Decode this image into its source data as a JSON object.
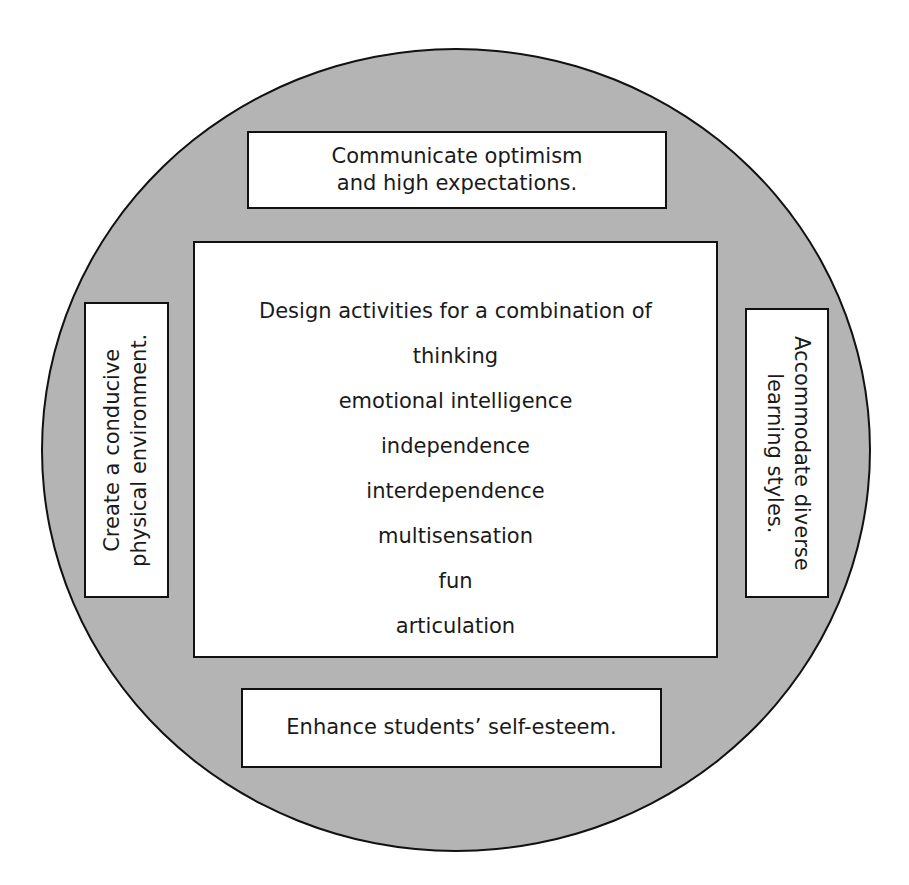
{
  "diagram": {
    "type": "concentric circle with surrounding boxes",
    "colors": {
      "circle_fill": "#b4b4b4",
      "box_fill": "#ffffff",
      "outline": "#111111"
    },
    "top_box": {
      "lines": [
        "Communicate optimism",
        "and high expectations."
      ]
    },
    "left_box": {
      "orientation": "rotated -90deg",
      "lines": [
        "Create a conducive",
        "physical environment."
      ]
    },
    "right_box": {
      "orientation": "rotated 90deg",
      "lines": [
        "Accommodate diverse",
        "learning styles."
      ]
    },
    "bottom_box": {
      "lines": [
        "Enhance students’ self-esteem."
      ]
    },
    "center_box": {
      "heading": "Design activities for a combination of",
      "items": [
        "thinking",
        "emotional intelligence",
        "independence",
        "interdependence",
        "multisensation",
        "fun",
        "articulation"
      ]
    }
  }
}
